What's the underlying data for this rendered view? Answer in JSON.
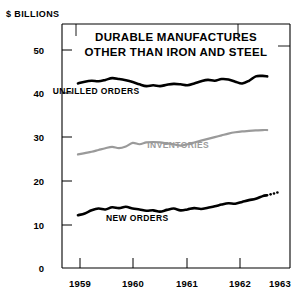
{
  "chart_data": {
    "type": "line",
    "title": "DURABLE MANUFACTURES OTHER THAN IRON AND STEEL",
    "title_lines": [
      "DURABLE MANUFACTURES",
      "OTHER THAN IRON AND STEEL"
    ],
    "unit_label": "$ BILLIONS",
    "xlabel": "",
    "ylabel": "$ BILLIONS",
    "ylim": [
      0,
      55
    ],
    "yticks": [
      0,
      10,
      20,
      30,
      40,
      50
    ],
    "ytick_labels": [
      "0",
      "10",
      "20",
      "30",
      "40",
      "50"
    ],
    "xlim": [
      1958.5,
      1963.5
    ],
    "xticks": [
      1959,
      1960,
      1961,
      1962,
      1963
    ],
    "xtick_labels": [
      "1959",
      "1960",
      "1961",
      "1962",
      "1963"
    ],
    "grid": false,
    "legend_position": "inline-annotations",
    "series": [
      {
        "name": "UNFILLED ORDERS",
        "color": "#000000",
        "label_x": 1959.25,
        "label_y": 39.2,
        "x": [
          1958.85,
          1959.0,
          1959.15,
          1959.3,
          1959.45,
          1959.6,
          1959.75,
          1959.9,
          1960.05,
          1960.2,
          1960.35,
          1960.5,
          1960.65,
          1960.8,
          1960.95,
          1961.1,
          1961.25,
          1961.4,
          1961.55,
          1961.7,
          1961.85,
          1962.0,
          1962.15,
          1962.3,
          1962.45,
          1962.6,
          1962.75,
          1962.9,
          1963.0
        ],
        "values": [
          41.6,
          42.0,
          42.2,
          42.1,
          42.4,
          42.8,
          42.6,
          42.3,
          41.9,
          41.4,
          41.0,
          41.2,
          41.0,
          41.3,
          41.5,
          41.4,
          41.2,
          41.6,
          42.1,
          42.4,
          42.2,
          42.6,
          42.5,
          42.0,
          41.6,
          42.2,
          43.2,
          43.3,
          43.2
        ]
      },
      {
        "name": "INVENTORIES",
        "color": "#9a9a9a",
        "label_x": 1961.05,
        "label_y": 27.1,
        "x": [
          1958.85,
          1959.0,
          1959.15,
          1959.3,
          1959.45,
          1959.6,
          1959.75,
          1959.9,
          1960.05,
          1960.2,
          1960.35,
          1960.5,
          1960.65,
          1960.8,
          1960.95,
          1961.1,
          1961.25,
          1961.4,
          1961.55,
          1961.7,
          1961.85,
          1962.0,
          1962.15,
          1962.3,
          1962.45,
          1962.6,
          1962.75,
          1962.9,
          1963.0
        ],
        "values": [
          25.6,
          25.9,
          26.2,
          26.6,
          27.0,
          27.3,
          27.0,
          27.4,
          28.2,
          27.9,
          28.3,
          28.4,
          28.3,
          28.1,
          27.9,
          27.6,
          27.9,
          28.3,
          28.7,
          29.1,
          29.5,
          29.9,
          30.3,
          30.6,
          30.8,
          30.9,
          31.0,
          31.1,
          31.1
        ]
      },
      {
        "name": "NEW ORDERS",
        "color": "#000000",
        "label_x": 1960.15,
        "label_y": 10.6,
        "dashed_tail": true,
        "x": [
          1958.85,
          1959.0,
          1959.15,
          1959.3,
          1959.45,
          1959.6,
          1959.75,
          1959.9,
          1960.05,
          1960.2,
          1960.35,
          1960.5,
          1960.65,
          1960.8,
          1960.95,
          1961.1,
          1961.25,
          1961.4,
          1961.55,
          1961.7,
          1961.85,
          1962.0,
          1962.15,
          1962.3,
          1962.45,
          1962.6,
          1962.75,
          1962.9,
          1963.0
        ],
        "values": [
          11.9,
          12.3,
          13.0,
          13.4,
          13.2,
          13.7,
          13.5,
          13.8,
          13.4,
          13.2,
          12.9,
          13.0,
          12.7,
          13.1,
          13.4,
          13.0,
          13.2,
          13.5,
          13.3,
          13.6,
          13.9,
          14.3,
          14.6,
          14.5,
          14.9,
          15.3,
          15.6,
          16.2,
          16.4
        ]
      }
    ]
  }
}
